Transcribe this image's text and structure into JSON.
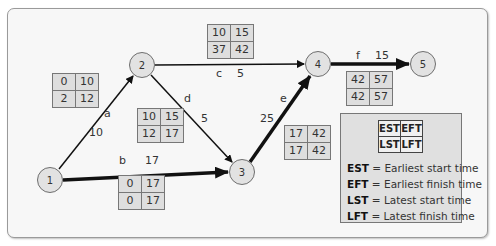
{
  "diagram": {
    "type": "activity-on-arrow network (critical path)",
    "nodes": [
      {
        "id": "1",
        "label": "1"
      },
      {
        "id": "2",
        "label": "2"
      },
      {
        "id": "3",
        "label": "3"
      },
      {
        "id": "4",
        "label": "4"
      },
      {
        "id": "5",
        "label": "5"
      }
    ],
    "activities": [
      {
        "name": "a",
        "from": "1",
        "to": "2",
        "duration": "10",
        "critical": false,
        "est": "0",
        "eft": "10",
        "lst": "2",
        "lft": "12"
      },
      {
        "name": "b",
        "from": "1",
        "to": "3",
        "duration": "17",
        "critical": true,
        "est": "0",
        "eft": "17",
        "lst": "0",
        "lft": "17"
      },
      {
        "name": "c",
        "from": "2",
        "to": "4",
        "duration": "5",
        "critical": false,
        "est": "10",
        "eft": "15",
        "lst": "37",
        "lft": "42"
      },
      {
        "name": "d",
        "from": "2",
        "to": "3",
        "duration": "5",
        "critical": false,
        "est": "10",
        "eft": "15",
        "lst": "12",
        "lft": "17"
      },
      {
        "name": "e",
        "from": "3",
        "to": "4",
        "duration": "25",
        "critical": true,
        "est": "17",
        "eft": "42",
        "lst": "17",
        "lft": "42"
      },
      {
        "name": "f",
        "from": "4",
        "to": "5",
        "duration": "15",
        "critical": true,
        "est": "42",
        "eft": "57",
        "lst": "42",
        "lft": "57"
      }
    ],
    "legend": {
      "table": [
        [
          "EST",
          "EFT"
        ],
        [
          "LST",
          "LFT"
        ]
      ],
      "definitions": [
        {
          "abbr": "EST",
          "text": "= Earliest start time"
        },
        {
          "abbr": "EFT",
          "text": "= Earliest finish time"
        },
        {
          "abbr": "LST",
          "text": "= Latest start time"
        },
        {
          "abbr": "LFT",
          "text": "= Latest finish time"
        }
      ]
    },
    "colors": {
      "panel_bg": "#f7f7f7",
      "node_fill": "#e2e2e2",
      "box_fill": "#dedede",
      "legend_fill": "#e0e0e0",
      "arrow": "#111111"
    }
  }
}
